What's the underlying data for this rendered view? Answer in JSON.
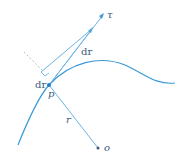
{
  "diagram": {
    "labels": {
      "tau": "τ",
      "dr_vector": "dr",
      "dr_scalar": "dr",
      "point": "p",
      "r": "r",
      "origin": "o"
    },
    "colors": {
      "curve": "#3a9ad9",
      "line": "#6cb4e4",
      "dashed": "#9cc8e8",
      "point": "#1f7fc8",
      "text": "#3a5a7a"
    }
  }
}
